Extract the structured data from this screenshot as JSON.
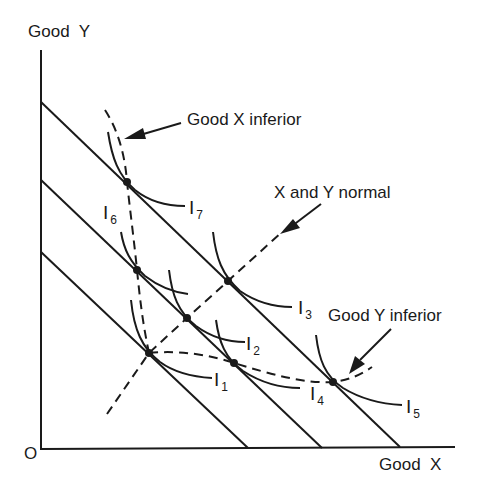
{
  "diagram": {
    "axes": {
      "y_label": "Good  Y",
      "x_label": "Good  X",
      "origin_label": "O"
    },
    "annotations": {
      "good_x_inferior": "Good X inferior",
      "x_and_y_normal": "X and Y normal",
      "good_y_inferior": "Good Y inferior"
    },
    "indifference_curves": [
      {
        "id": "I1",
        "letter": "I",
        "sub": "1"
      },
      {
        "id": "I2",
        "letter": "I",
        "sub": "2"
      },
      {
        "id": "I3",
        "letter": "I",
        "sub": "3"
      },
      {
        "id": "I4",
        "letter": "I",
        "sub": "4"
      },
      {
        "id": "I5",
        "letter": "I",
        "sub": "5"
      },
      {
        "id": "I6",
        "letter": "I",
        "sub": "6"
      },
      {
        "id": "I7",
        "letter": "I",
        "sub": "7"
      }
    ],
    "budget_lines": [
      {
        "name": "budget-line-1",
        "y_intercept": [
          41,
          252
        ],
        "x_intercept": [
          248,
          447
        ]
      },
      {
        "name": "budget-line-2",
        "y_intercept": [
          41,
          180
        ],
        "x_intercept": [
          322,
          447
        ]
      },
      {
        "name": "budget-line-3",
        "y_intercept": [
          41,
          102
        ],
        "x_intercept": [
          400,
          447
        ]
      }
    ],
    "equilibrium_points": [
      {
        "name": "point-i1",
        "curve": "I1",
        "x": 149,
        "y": 353
      },
      {
        "name": "point-i6",
        "curve": "I6",
        "x": 137,
        "y": 270
      },
      {
        "name": "point-i2",
        "curve": "I2",
        "x": 187,
        "y": 318
      },
      {
        "name": "point-i4",
        "curve": "I4",
        "x": 234,
        "y": 363
      },
      {
        "name": "point-i7",
        "curve": "I7",
        "x": 127,
        "y": 182
      },
      {
        "name": "point-i3",
        "curve": "I3",
        "x": 228,
        "y": 281
      },
      {
        "name": "point-i5",
        "curve": "I5",
        "x": 333,
        "y": 382
      }
    ],
    "colors": {
      "ink": "#1a1a1a",
      "background": "#ffffff"
    }
  }
}
